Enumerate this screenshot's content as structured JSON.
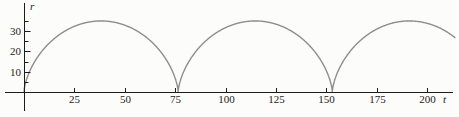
{
  "chart_data": {
    "type": "line",
    "title": "",
    "xlabel": "t",
    "ylabel": "r",
    "x_ticks": [
      25,
      50,
      75,
      100,
      125,
      150,
      175,
      200
    ],
    "y_major_ticks": [
      10,
      20,
      30
    ],
    "y_minor_ticks": [
      5,
      15,
      25,
      35
    ],
    "x_range": [
      0,
      214
    ],
    "y_range": [
      0,
      37
    ],
    "grid": false,
    "legend": false,
    "curve": {
      "shape": "cycloid-arches",
      "description": "r(t): repeating cycloidal arches touching r=0 with vertical-tangent cusps",
      "max_r": 35,
      "period": 76.5,
      "cusp_ts": [
        0,
        76.5,
        153
      ],
      "t_start": 0,
      "t_end": 214
    },
    "sample_points": [
      [
        0,
        0
      ],
      [
        2.2,
        8.8
      ],
      [
        7.0,
        17.5
      ],
      [
        15.0,
        26.3
      ],
      [
        25.8,
        32.7
      ],
      [
        38.3,
        35.0
      ],
      [
        50.7,
        32.7
      ],
      [
        61.5,
        26.3
      ],
      [
        69.5,
        17.5
      ],
      [
        74.3,
        8.8
      ],
      [
        76.5,
        0
      ],
      [
        78.7,
        8.8
      ],
      [
        83.5,
        17.5
      ],
      [
        91.5,
        26.3
      ],
      [
        102.3,
        32.7
      ],
      [
        114.8,
        35.0
      ],
      [
        127.2,
        32.7
      ],
      [
        138.0,
        26.3
      ],
      [
        146.0,
        17.5
      ],
      [
        150.8,
        8.8
      ],
      [
        153,
        0
      ],
      [
        155.2,
        8.8
      ],
      [
        160.0,
        17.5
      ],
      [
        168.0,
        26.3
      ],
      [
        178.8,
        32.7
      ],
      [
        191.3,
        35.0
      ],
      [
        203.7,
        32.7
      ],
      [
        214,
        25.8
      ]
    ],
    "colors": {
      "axis": "#1c1c1c",
      "curve": "#8d8d8d",
      "label": "#222222",
      "background": "#fcfcfa"
    }
  }
}
